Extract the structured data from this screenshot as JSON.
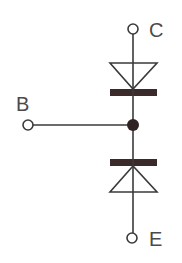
{
  "diagram": {
    "type": "transistor-equivalent-diode-model",
    "colors": {
      "wire": "#3a3a3a",
      "bar": "#3b2a2a",
      "node": "#2e2222",
      "label": "#4a4a4a",
      "background": "#ffffff"
    },
    "terminals": [
      {
        "id": "collector",
        "label": "C"
      },
      {
        "id": "base",
        "label": "B"
      },
      {
        "id": "emitter",
        "label": "E"
      }
    ],
    "components": [
      {
        "id": "diode-upper",
        "symbol": "diode",
        "from": "junction",
        "to": "collector",
        "orientation": "anode-top-cathode-bottom"
      },
      {
        "id": "diode-lower",
        "symbol": "diode",
        "from": "junction",
        "to": "emitter",
        "orientation": "cathode-top-anode-bottom"
      }
    ],
    "labels": {
      "collector": "C",
      "base": "B",
      "emitter": "E"
    }
  }
}
